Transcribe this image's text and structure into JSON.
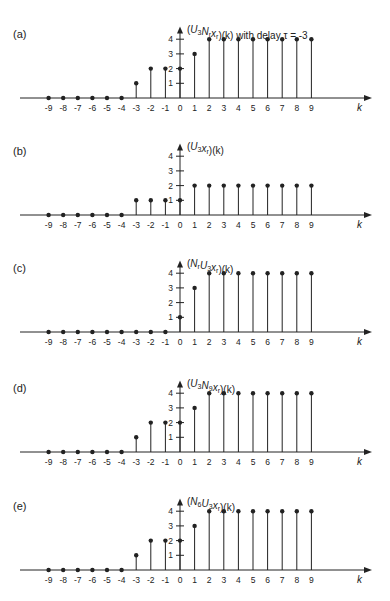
{
  "figure": {
    "background": "#ffffff",
    "ink_color": "#222222",
    "x_axis_symbol": "k"
  },
  "chart_data": [
    {
      "type": "stem",
      "panel_label": "(a)",
      "title": "(U3 Nr xr)(k) with delay τ = -3",
      "title_parts": {
        "pre": "(U",
        "sub1": "3",
        "mid": "N",
        "sub2": "r",
        "mid2": "x",
        "sub3": "r",
        "post": ")(k) with delay τ = -3"
      },
      "xlabel": "k",
      "x": [
        -9,
        -8,
        -7,
        -6,
        -5,
        -4,
        -3,
        -2,
        -1,
        0,
        1,
        2,
        3,
        4,
        5,
        6,
        7,
        8,
        9
      ],
      "values": [
        0,
        0,
        0,
        0,
        0,
        0,
        1,
        2,
        2,
        2,
        3,
        4,
        4,
        4,
        4,
        4,
        4,
        4,
        4
      ],
      "yticks": [
        1,
        2,
        3,
        4
      ],
      "ylim": [
        0,
        4.8
      ],
      "baseline_y": 98
    },
    {
      "type": "stem",
      "panel_label": "(b)",
      "title": "(U3 xr)(k)",
      "title_parts": {
        "pre": "(U",
        "sub1": "3",
        "mid": "",
        "sub2": "",
        "mid2": "x",
        "sub3": "r",
        "post": ")(k)"
      },
      "xlabel": "k",
      "x": [
        -9,
        -8,
        -7,
        -6,
        -5,
        -4,
        -3,
        -2,
        -1,
        0,
        1,
        2,
        3,
        4,
        5,
        6,
        7,
        8,
        9
      ],
      "values": [
        0,
        0,
        0,
        0,
        0,
        0,
        1,
        1,
        1,
        1,
        2,
        2,
        2,
        2,
        2,
        2,
        2,
        2,
        2
      ],
      "yticks": [
        1,
        2,
        3,
        4
      ],
      "ylim": [
        0,
        4.8
      ],
      "baseline_y": 215
    },
    {
      "type": "stem",
      "panel_label": "(c)",
      "title": "(Nr U3 xr)(k)",
      "title_parts": {
        "pre": "(N",
        "sub1": "r",
        "mid": "U",
        "sub2": "3",
        "mid2": "x",
        "sub3": "r",
        "post": ")(k)"
      },
      "xlabel": "k",
      "x": [
        -9,
        -8,
        -7,
        -6,
        -5,
        -4,
        -3,
        -2,
        -1,
        0,
        1,
        2,
        3,
        4,
        5,
        6,
        7,
        8,
        9
      ],
      "values": [
        0,
        0,
        0,
        0,
        0,
        0,
        0,
        0,
        0,
        1,
        3,
        4,
        4,
        4,
        4,
        4,
        4,
        4,
        4
      ],
      "yticks": [
        1,
        2,
        3,
        4
      ],
      "ylim": [
        0,
        4.8
      ],
      "baseline_y": 332
    },
    {
      "type": "stem",
      "panel_label": "(d)",
      "title": "(U3 N9 xr)(k)",
      "title_parts": {
        "pre": "(U",
        "sub1": "3",
        "mid": "N",
        "sub2": "9",
        "mid2": "x",
        "sub3": "r",
        "post": ")(k)"
      },
      "xlabel": "k",
      "x": [
        -9,
        -8,
        -7,
        -6,
        -5,
        -4,
        -3,
        -2,
        -1,
        0,
        1,
        2,
        3,
        4,
        5,
        6,
        7,
        8,
        9
      ],
      "values": [
        0,
        0,
        0,
        0,
        0,
        0,
        1,
        2,
        2,
        2,
        3,
        4,
        4,
        4,
        4,
        4,
        4,
        4,
        4
      ],
      "yticks": [
        1,
        2,
        3,
        4
      ],
      "ylim": [
        0,
        4.8
      ],
      "baseline_y": 452
    },
    {
      "type": "stem",
      "panel_label": "(e)",
      "title": "(N6 U3 xr)(k)",
      "title_parts": {
        "pre": "(N",
        "sub1": "6",
        "mid": "U",
        "sub2": "3",
        "mid2": "x",
        "sub3": "r",
        "post": ")(k)"
      },
      "xlabel": "k",
      "x": [
        -9,
        -8,
        -7,
        -6,
        -5,
        -4,
        -3,
        -2,
        -1,
        0,
        1,
        2,
        3,
        4,
        5,
        6,
        7,
        8,
        9
      ],
      "values": [
        0,
        0,
        0,
        0,
        0,
        0,
        1,
        2,
        2,
        2,
        3,
        4,
        4,
        4,
        4,
        4,
        4,
        4,
        4
      ],
      "yticks": [
        1,
        2,
        3,
        4
      ],
      "ylim": [
        0,
        4.8
      ],
      "baseline_y": 570
    }
  ]
}
